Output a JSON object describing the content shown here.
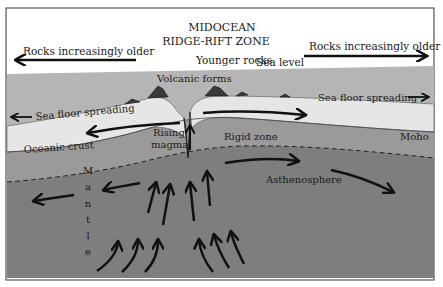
{
  "title": {
    "line1": "MIDOCEAN",
    "line2": "RIDGE-RIFT ZONE"
  },
  "labels": {
    "younger_rocks": "Younger rocks",
    "sea_level": "Sea level",
    "rocks_older_left": "Rocks increasingly older",
    "rocks_older_right": "Rocks increasingly older",
    "volcanic_forms": "Volcanic forms",
    "sea_floor_spreading_left": "Sea floor spreading",
    "sea_floor_spreading_right": "Sea floor spreading",
    "oceanic_crust": "Oceanic crust",
    "rising_magma_1": "Rising",
    "rising_magma_2": "magma",
    "rigid_zone": "Rigid  zone",
    "moho": "Moho",
    "asthenosphere": "Asthenosphere",
    "mantle_letters": [
      "M",
      "a",
      "n",
      "t",
      "l",
      "e"
    ]
  },
  "colors": {
    "sky": "#ffffff",
    "ocean": "#b5b5b5",
    "crust": "#e6e6e6",
    "rigid_zone": "#9a9a9a",
    "mantle": "#7e7e7e",
    "ink": "#111111"
  }
}
